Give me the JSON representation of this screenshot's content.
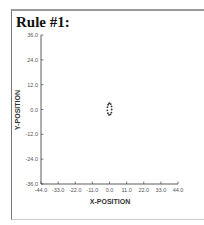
{
  "title": "Rule #1:",
  "chart_data": {
    "type": "scatter",
    "title": "Rule #1:",
    "xlabel": "X-POSITION",
    "ylabel": "Y-POSITION",
    "xlim": [
      -44.0,
      44.0
    ],
    "ylim": [
      -36.0,
      36.0
    ],
    "xticks": [
      "-44.0",
      "-33.0",
      "-22.0",
      "-11.0",
      "0.0",
      "11.0",
      "22.0",
      "33.0",
      "44.0"
    ],
    "yticks": [
      "36.0",
      "24.0",
      "12.0",
      "0.0",
      "-12.0",
      "-24.0",
      "-36.0"
    ],
    "grid": false,
    "legend": null,
    "series": [
      {
        "name": "trajectory",
        "description": "small closed loop of points around origin, slightly above",
        "points": [
          [
            0.0,
            3.0
          ],
          [
            0.8,
            2.6
          ],
          [
            1.3,
            1.5
          ],
          [
            1.4,
            0.0
          ],
          [
            1.2,
            -1.5
          ],
          [
            0.6,
            -2.4
          ],
          [
            -0.3,
            -2.6
          ],
          [
            -1.0,
            -1.8
          ],
          [
            -1.4,
            -0.4
          ],
          [
            -1.3,
            1.1
          ],
          [
            -0.9,
            2.3
          ],
          [
            -0.3,
            3.0
          ]
        ]
      }
    ]
  }
}
